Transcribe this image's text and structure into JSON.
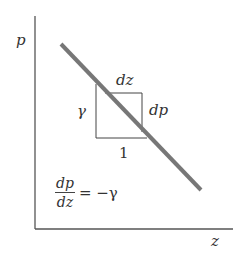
{
  "diagram": {
    "type": "pressure-depth relation",
    "axes": {
      "y_label": "p",
      "x_label": "z",
      "color": "#555555"
    },
    "line": {
      "description": "straight line with negative slope",
      "color": "#777777",
      "x1": 61,
      "y1": 44,
      "x2": 201,
      "y2": 190
    },
    "slope_triangle": {
      "top_label": "dz",
      "right_label": "dp",
      "left_label": "γ",
      "bottom_label": "1"
    },
    "equation": {
      "numerator": "dp",
      "denominator": "dz",
      "rhs": "= −γ"
    }
  }
}
